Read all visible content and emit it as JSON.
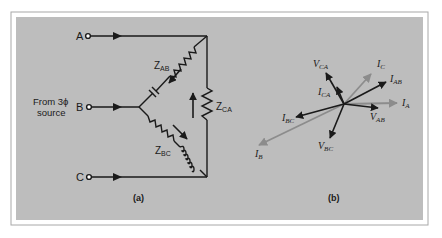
{
  "figure": {
    "panel_color": "#bdbdbd",
    "frame_color": "#9a9a9a",
    "wire_color": "#1a1a1a",
    "gray_phasor_color": "#8c8c8c"
  },
  "circuit": {
    "caption": "(a)",
    "source_label_line1": "From 3ϕ",
    "source_label_line2": "source",
    "terminals": [
      {
        "label": "A"
      },
      {
        "label": "B"
      },
      {
        "label": "C"
      }
    ],
    "impedances": {
      "ab": {
        "main": "Z",
        "sub": "AB"
      },
      "bc": {
        "main": "Z",
        "sub": "BC"
      },
      "ca": {
        "main": "Z",
        "sub": "CA"
      }
    }
  },
  "phasor": {
    "caption": "(b)",
    "labels": {
      "v_ca": {
        "main": "V",
        "sub": "CA"
      },
      "i_ca": {
        "main": "I",
        "sub": "CA"
      },
      "i_c": {
        "main": "I",
        "sub": "C"
      },
      "i_ab": {
        "main": "I",
        "sub": "AB"
      },
      "i_a": {
        "main": "I",
        "sub": "A"
      },
      "v_ab": {
        "main": "V",
        "sub": "AB"
      },
      "i_bc": {
        "main": "I",
        "sub": "BC"
      },
      "i_b": {
        "main": "I",
        "sub": "B"
      },
      "v_bc": {
        "main": "V",
        "sub": "BC"
      }
    }
  }
}
